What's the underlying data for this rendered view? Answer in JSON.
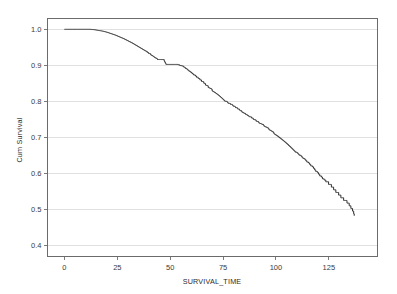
{
  "figure": {
    "background_color": "#ffffff",
    "plot_border_color": "#6b6b6b",
    "grid_color": "#d9d9d9",
    "curve_color": "#2e2e2e"
  },
  "chart_data": {
    "type": "line",
    "title": "",
    "xlabel": "SURVIVAL_TIME",
    "ylabel": "Cum Survival",
    "xlim": [
      -8,
      148
    ],
    "ylim": [
      0.37,
      1.03
    ],
    "xticks": [
      0,
      25,
      50,
      75,
      100,
      125
    ],
    "xtick_labels": [
      "0",
      "25",
      "50",
      "75",
      "100",
      "125"
    ],
    "yticks": [
      0.4,
      0.5,
      0.6,
      0.7,
      0.8,
      0.9,
      1.0
    ],
    "ytick_labels": [
      "0.4",
      "0.5",
      "0.6",
      "0.7",
      "0.8",
      "0.9",
      "1.0"
    ],
    "grid": "horizontal",
    "legend": "none",
    "step_style": "kaplan-meier",
    "series": [
      {
        "name": "Cum Survival",
        "x": [
          0,
          4,
          8,
          12,
          14,
          16,
          18,
          20,
          22,
          24,
          26,
          28,
          30,
          32,
          34,
          36,
          38,
          40,
          42,
          44,
          46,
          48,
          50,
          52,
          54,
          56,
          58,
          60,
          62,
          64,
          66,
          68,
          70,
          72,
          74,
          76,
          78,
          80,
          82,
          84,
          86,
          88,
          90,
          92,
          94,
          96,
          98,
          100,
          102,
          104,
          106,
          108,
          110,
          112,
          114,
          116,
          118,
          120,
          122,
          124,
          126,
          128,
          130,
          132,
          134,
          136,
          137
        ],
        "y": [
          1.0,
          1.0,
          1.0,
          1.0,
          0.999,
          0.997,
          0.995,
          0.992,
          0.988,
          0.984,
          0.979,
          0.974,
          0.968,
          0.962,
          0.955,
          0.948,
          0.941,
          0.933,
          0.925,
          0.917,
          0.929,
          0.901,
          0.919,
          0.909,
          0.902,
          0.898,
          0.889,
          0.88,
          0.871,
          0.861,
          0.851,
          0.84,
          0.83,
          0.82,
          0.81,
          0.802,
          0.795,
          0.788,
          0.78,
          0.772,
          0.764,
          0.757,
          0.75,
          0.742,
          0.735,
          0.727,
          0.718,
          0.708,
          0.698,
          0.688,
          0.678,
          0.668,
          0.658,
          0.648,
          0.638,
          0.627,
          0.614,
          0.601,
          0.589,
          0.578,
          0.566,
          0.553,
          0.54,
          0.528,
          0.519,
          0.5,
          0.486
        ]
      }
    ]
  }
}
